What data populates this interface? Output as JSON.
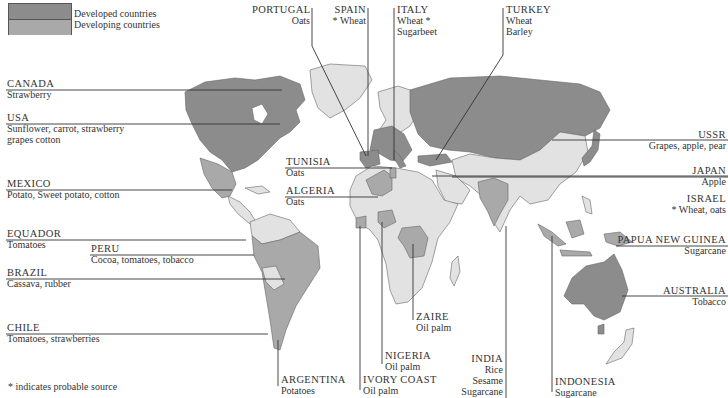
{
  "colors": {
    "developed": "#8c8c8c",
    "developing": "#a9a9a9",
    "other_land": "#e2e2e2",
    "ocean": "#ffffff",
    "line": "#333333"
  },
  "legend": {
    "items": [
      {
        "label": "Developed countries",
        "color": "#8c8c8c"
      },
      {
        "label": "Developing countries",
        "color": "#a9a9a9"
      }
    ]
  },
  "footnote": "* indicates probable source",
  "labels": [
    {
      "country": "CANADA",
      "crops": [
        "Strawberry"
      ]
    },
    {
      "country": "USA",
      "crops": [
        "Sunflower, carrot, strawberry",
        "grapes cotton"
      ]
    },
    {
      "country": "MEXICO",
      "crops": [
        "Potato, Sweet potato, cotton"
      ]
    },
    {
      "country": "EQUADOR",
      "crops": [
        "Tomatoes"
      ]
    },
    {
      "country": "PERU",
      "crops": [
        "Cocoa, tomatoes, tobacco"
      ]
    },
    {
      "country": "BRAZIL",
      "crops": [
        "Cassava, rubber"
      ]
    },
    {
      "country": "CHILE",
      "crops": [
        "Tomatoes, strawberries"
      ]
    },
    {
      "country": "PORTUGAL",
      "crops": [
        "Oats"
      ]
    },
    {
      "country": "SPAIN",
      "crops": [
        "* Wheat"
      ]
    },
    {
      "country": "ITALY",
      "crops": [
        "Wheat *",
        "Sugarbeet"
      ]
    },
    {
      "country": "TURKEY",
      "crops": [
        "Wheat",
        "Barley"
      ]
    },
    {
      "country": "TUNISIA",
      "crops": [
        "Oats"
      ]
    },
    {
      "country": "ALGERIA",
      "crops": [
        "Oats"
      ]
    },
    {
      "country": "USSR",
      "crops": [
        "Grapes, apple, pear"
      ]
    },
    {
      "country": "JAPAN",
      "crops": [
        "Apple"
      ]
    },
    {
      "country": "ISRAEL",
      "crops": [
        "* Wheat, oats"
      ]
    },
    {
      "country": "PAPUA NEW GUINEA",
      "crops": [
        "Sugarcane"
      ]
    },
    {
      "country": "AUSTRALIA",
      "crops": [
        "Tobacco"
      ]
    },
    {
      "country": "ZAIRE",
      "crops": [
        "Oil palm"
      ]
    },
    {
      "country": "NIGERIA",
      "crops": [
        "Oil palm"
      ]
    },
    {
      "country": "ARGENTINA",
      "crops": [
        "Potatoes"
      ]
    },
    {
      "country": "IVORY COAST",
      "crops": [
        "Oil palm"
      ]
    },
    {
      "country": "INDIA",
      "crops": [
        "Rice",
        "Sesame",
        "Sugarcane"
      ]
    },
    {
      "country": "INDONESIA",
      "crops": [
        "Sugarcane"
      ]
    }
  ]
}
